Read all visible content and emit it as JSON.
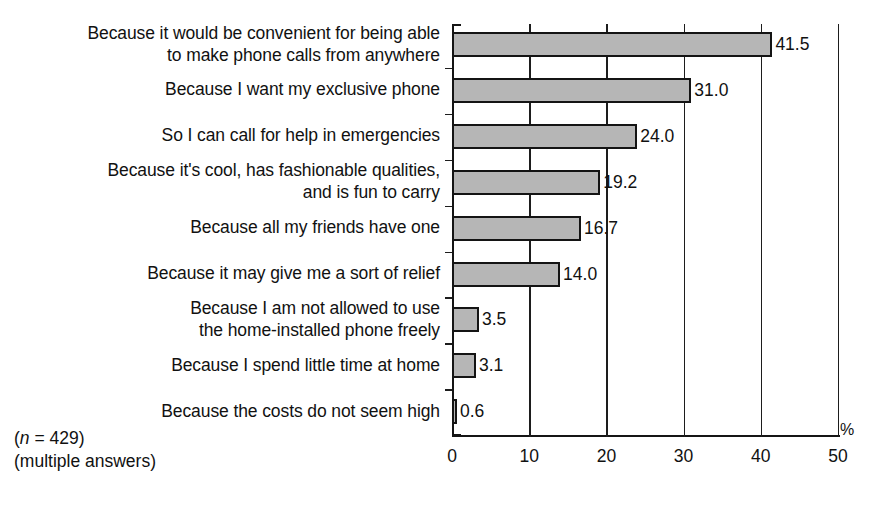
{
  "chart_data": {
    "type": "bar",
    "orientation": "horizontal",
    "title": "",
    "xlabel": "%",
    "ylabel": "",
    "xlim": [
      0,
      50
    ],
    "xticks": [
      0,
      10,
      20,
      30,
      40,
      50
    ],
    "xtick_labels": [
      "0",
      "10",
      "20",
      "30",
      "40",
      "50"
    ],
    "grid": true,
    "grid_axis": "x",
    "legend": false,
    "bar_fill_color": "#b6b6b6",
    "bar_edge_color": "#141414",
    "categories": [
      "Because it would be convenient for being able\nto make phone calls from anywhere",
      "Because I want my exclusive phone",
      "So I can call for help in emergencies",
      "Because it's cool, has fashionable qualities,\nand is fun to carry",
      "Because all my friends have one",
      "Because it may give me a sort of relief",
      "Because I am not allowed to use\nthe home-installed phone freely",
      "Because I spend little time at home",
      "Because the costs do not seem high"
    ],
    "values": [
      41.5,
      31.0,
      24.0,
      19.2,
      16.7,
      14.0,
      3.5,
      3.1,
      0.6
    ],
    "value_labels": [
      "41.5",
      "31.0",
      "24.0",
      "19.2",
      "16.7",
      "14.0",
      "3.5",
      "3.1",
      "0.6"
    ]
  },
  "annotations": {
    "sample_size_prefix": "(",
    "sample_size_italic": "n",
    "sample_size_rest": " = 429)",
    "multiple_answers": "(multiple answers)"
  },
  "axis": {
    "percent_symbol": "%"
  }
}
